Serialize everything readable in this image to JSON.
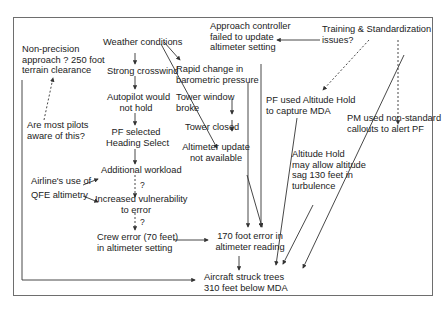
{
  "nodes": {
    "non_precision": [
      "Non-precision",
      "approach ? 250 foot",
      "terrain clearance"
    ],
    "pilots_aware": [
      "Are most pilots",
      "aware of this?"
    ],
    "weather": "Weather conditions",
    "crosswind": "Strong crosswind",
    "autopilot": [
      "Autopilot would",
      "not hold"
    ],
    "heading_select": [
      "PF selected",
      "Heading Select"
    ],
    "workload": "Additional workload",
    "airline_use": "Airline's use of",
    "qfe": "QFE altimetry",
    "vulnerability": [
      "Increased vulnerability",
      "to error"
    ],
    "crew_error": [
      "Crew error (70 feet)",
      "in altimeter setting"
    ],
    "rapid_change": [
      "Rapid change in",
      "barometric pressure"
    ],
    "tower_window": [
      "Tower window",
      "broke"
    ],
    "tower_closed": "Tower closed",
    "altimeter_update": [
      "Altimeter update",
      "not available"
    ],
    "approach_controller": [
      "Approach controller",
      "failed to update",
      "altimeter setting"
    ],
    "training": [
      "Training & Standardization",
      "issues?"
    ],
    "pf_alt_hold": [
      "PF used Altitude Hold",
      "to capture MDA"
    ],
    "pm_callouts": [
      "PM used non-standard",
      "callouts to alert PF"
    ],
    "alt_hold_sag": [
      "Altitude Hold",
      "may allow altitude",
      "sag 130 feet in",
      "turbulence"
    ],
    "error_170": [
      "170 foot error in",
      "altimeter reading"
    ],
    "struck_trees": [
      "Aircraft struck trees",
      "310 feet below MDA"
    ]
  },
  "question_marks": [
    "?",
    "?",
    "?"
  ],
  "colors": {
    "line": "#333333",
    "frame": "#6e6e6e",
    "text": "#222222"
  }
}
